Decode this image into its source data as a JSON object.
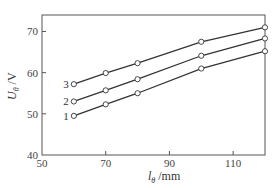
{
  "chart_data": {
    "type": "line",
    "title": "",
    "xlabel": "lθ /mm",
    "ylabel": "Uθ /V",
    "xlabel_parts": {
      "var": "l",
      "sub": "θ",
      "unit": " /mm"
    },
    "ylabel_parts": {
      "var": "U",
      "sub": "θ",
      "unit": " /V"
    },
    "xlim": [
      50,
      120
    ],
    "ylim": [
      40,
      74
    ],
    "xticks": [
      50,
      70,
      90,
      110
    ],
    "yticks": [
      40,
      50,
      60,
      70
    ],
    "grid": false,
    "legend": "inline labels at left end of each line",
    "x": [
      60,
      70,
      80,
      100,
      120
    ],
    "series": [
      {
        "name": "1",
        "values": [
          49.5,
          52.3,
          55.0,
          61.0,
          65.2
        ]
      },
      {
        "name": "2",
        "values": [
          53.0,
          55.7,
          58.4,
          64.1,
          68.3
        ]
      },
      {
        "name": "3",
        "values": [
          57.2,
          59.9,
          62.3,
          67.5,
          71.0
        ]
      }
    ],
    "marker": "open-circle",
    "line_color": "#333333"
  }
}
